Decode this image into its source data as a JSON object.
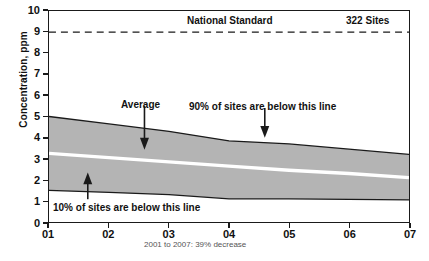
{
  "chart_data": {
    "type": "area",
    "title": "",
    "subtitle": "",
    "xlabel": "",
    "ylabel": "Concentration, ppm",
    "x": [
      "01",
      "02",
      "03",
      "04",
      "05",
      "06",
      "07"
    ],
    "categories": [
      "01",
      "02",
      "03",
      "04",
      "05",
      "06",
      "07"
    ],
    "xlim": [
      0,
      6
    ],
    "ylim": [
      0,
      10
    ],
    "y_ticks": [
      0,
      1,
      2,
      3,
      4,
      5,
      6,
      7,
      8,
      9,
      10
    ],
    "x_ticks": [
      "01",
      "02",
      "03",
      "04",
      "05",
      "06",
      "07"
    ],
    "grid": false,
    "legend_position": "none",
    "series": [
      {
        "name": "90% of sites are below this line",
        "role": "band-upper",
        "values": [
          5.0,
          4.65,
          4.3,
          3.85,
          3.7,
          3.45,
          3.2
        ]
      },
      {
        "name": "Average",
        "role": "average-line",
        "values": [
          3.25,
          3.05,
          2.85,
          2.65,
          2.45,
          2.3,
          2.1
        ]
      },
      {
        "name": "10% of sites are below this line",
        "role": "band-lower",
        "values": [
          1.5,
          1.4,
          1.3,
          1.1,
          1.1,
          1.07,
          1.05
        ]
      }
    ],
    "reference_lines": [
      {
        "label": "National Standard",
        "value": 9,
        "style": "dashed"
      }
    ],
    "annotations": [
      {
        "text": "National Standard",
        "x": 2.95,
        "y": 9.6
      },
      {
        "text": "322 Sites",
        "x": 5.55,
        "y": 9.6
      },
      {
        "text": "Average",
        "x": 0.45,
        "y": 5.5
      },
      {
        "text": "90% of sites are below this line",
        "x": 2.55,
        "y": 5.45
      },
      {
        "text": "10% of sites are below this line",
        "x": 0.25,
        "y": 0.45
      }
    ],
    "caption": "2001 to 2007: 39% decrease",
    "colors": {
      "band_fill": "#b4b4b4",
      "band_line": "#1a1a1a",
      "average_line": "#ffffff",
      "axis": "#1a1a1a",
      "text": "#111111",
      "caption_text": "#555555",
      "background": "#ffffff"
    }
  },
  "axes": {
    "y_title": "Concentration, ppm",
    "y_tick_labels": [
      "10",
      "9",
      "8",
      "7",
      "6",
      "5",
      "4",
      "3",
      "2",
      "1",
      "0"
    ],
    "x_tick_labels": [
      "01",
      "02",
      "03",
      "04",
      "05",
      "06",
      "07"
    ]
  },
  "labels": {
    "national_standard": "National Standard",
    "site_count": "322 Sites",
    "average": "Average",
    "upper_band": "90% of sites are below this line",
    "lower_band": "10% of sites are below this line",
    "caption": "2001 to 2007: 39% decrease"
  }
}
